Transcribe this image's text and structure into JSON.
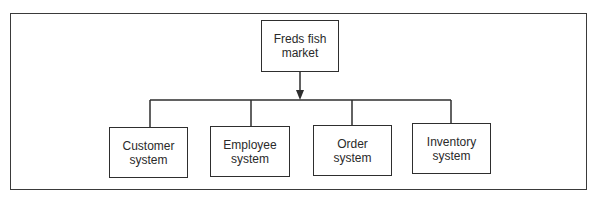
{
  "diagram": {
    "type": "hierarchy",
    "root": {
      "label_line1": "Freds fish",
      "label_line2": "market"
    },
    "children": [
      {
        "label_line1": "Customer",
        "label_line2": "system"
      },
      {
        "label_line1": "Employee",
        "label_line2": "system"
      },
      {
        "label_line1": "Order",
        "label_line2": "system"
      },
      {
        "label_line1": "Inventory",
        "label_line2": "system"
      }
    ],
    "colors": {
      "line": "#2e2e2e",
      "background": "#ffffff",
      "text": "#2a2a2a"
    }
  }
}
